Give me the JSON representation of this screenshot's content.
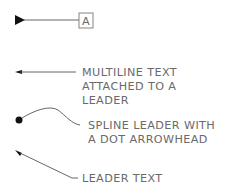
{
  "diagram": {
    "leaders": [
      {
        "id": "tolerance",
        "text": [
          "A"
        ],
        "arrow": "filled-triangle"
      },
      {
        "id": "multiline",
        "text": [
          "MULTILINE  TEXT",
          "ATTACHED  TO  A",
          "LEADER"
        ],
        "arrow": "small-arrow"
      },
      {
        "id": "spline",
        "text": [
          "SPLINE  LEADER  WITH",
          "A  DOT  ARROWHEAD"
        ],
        "arrow": "dot"
      },
      {
        "id": "simple",
        "text": [
          "LEADER  TEXT"
        ],
        "arrow": "small-arrow"
      }
    ],
    "colors": {
      "line": "#6a6a6a",
      "arrow": "#111111",
      "background": "#ffffff"
    }
  }
}
